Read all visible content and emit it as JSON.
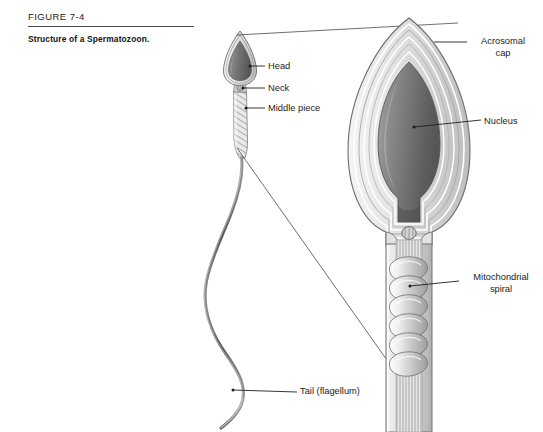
{
  "figure": {
    "number": "FIGURE 7-4",
    "caption": "Structure of a Spermatozoon."
  },
  "labels": {
    "head": "Head",
    "neck": "Neck",
    "middle_piece": "Middle piece",
    "tail": "Tail (flagellum)",
    "acrosomal_cap_line1": "Acrosomal",
    "acrosomal_cap_line2": "cap",
    "nucleus": "Nucleus",
    "mitochondrial_line1": "Mitochondrial",
    "mitochondrial_line2": "spiral"
  },
  "colors": {
    "ink": "#1c1c1c",
    "rule": "#4a4a4a",
    "nucleus_dark": "#5f5f5f",
    "nucleus_mid": "#8c8c8c",
    "nucleus_light": "#b8b8b8",
    "membrane": "#d8d8d8",
    "outline": "#6e6e6e",
    "leader": "#2a2a2a",
    "background": "#ffffff"
  }
}
